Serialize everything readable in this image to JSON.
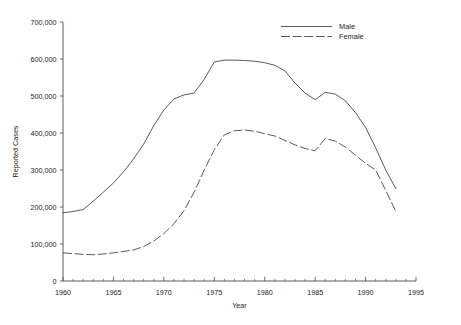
{
  "chart_data": {
    "type": "line",
    "title": "",
    "xlabel": "Year",
    "ylabel": "Reported Cases",
    "xlim": [
      1960,
      1995
    ],
    "ylim": [
      0,
      700000
    ],
    "grid": false,
    "legend_position": "top-right",
    "x_ticks": [
      1960,
      1965,
      1970,
      1975,
      1980,
      1985,
      1990,
      1995
    ],
    "x_tick_labels": [
      "1960",
      "1965",
      "1970",
      "1975",
      "1980",
      "1985",
      "1990",
      "1995"
    ],
    "x_minor_tick_step": 1,
    "y_ticks": [
      0,
      100000,
      200000,
      300000,
      400000,
      500000,
      600000,
      700000
    ],
    "y_tick_labels": [
      "0",
      "100,000",
      "200,000",
      "300,000",
      "400,000",
      "500,000",
      "600,000",
      "700,000"
    ],
    "x": [
      1960,
      1961,
      1962,
      1963,
      1964,
      1965,
      1966,
      1967,
      1968,
      1969,
      1970,
      1971,
      1972,
      1973,
      1974,
      1975,
      1976,
      1977,
      1978,
      1979,
      1980,
      1981,
      1982,
      1983,
      1984,
      1985,
      1986,
      1987,
      1988,
      1989,
      1990,
      1991,
      1992,
      1993
    ],
    "series": [
      {
        "name": "Male",
        "style": "solid",
        "color": "#3c3c3c",
        "values": [
          184000,
          188000,
          193000,
          216000,
          240000,
          265000,
          295000,
          330000,
          370000,
          420000,
          462000,
          492000,
          503000,
          508000,
          545000,
          592000,
          597000,
          597000,
          596000,
          594000,
          590000,
          583000,
          568000,
          535000,
          508000,
          490000,
          510000,
          505000,
          487000,
          455000,
          415000,
          360000,
          300000,
          250000
        ]
      },
      {
        "name": "Female",
        "style": "dashed",
        "color": "#3c3c3c",
        "values": [
          76000,
          74000,
          72000,
          71000,
          73000,
          76000,
          80000,
          84000,
          93000,
          108000,
          128000,
          155000,
          190000,
          240000,
          300000,
          355000,
          395000,
          406000,
          408000,
          405000,
          398000,
          392000,
          380000,
          368000,
          358000,
          352000,
          385000,
          378000,
          362000,
          340000,
          318000,
          300000,
          245000,
          188000
        ]
      }
    ],
    "annotations": []
  },
  "legend": {
    "items": [
      {
        "label": "Male"
      },
      {
        "label": "Female"
      }
    ]
  }
}
